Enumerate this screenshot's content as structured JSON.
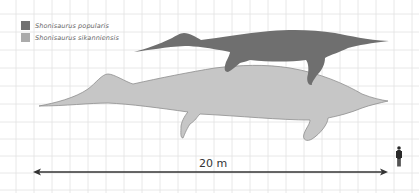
{
  "legend": {
    "items": [
      {
        "label": "Shonisaurus popularis",
        "color": "#727272"
      },
      {
        "label": "Shonisaurus sikanniensis",
        "color": "#ababab"
      }
    ]
  },
  "scale": {
    "label": "20 m"
  },
  "colors": {
    "grid": "#e2e2e2",
    "popularis_fill": "#6f6f6f",
    "sikanniensis_fill": "#c6c6c6",
    "sikanniensis_outline": "#8e8e8e",
    "human": "#2a2a2a",
    "arrow": "#333333"
  }
}
